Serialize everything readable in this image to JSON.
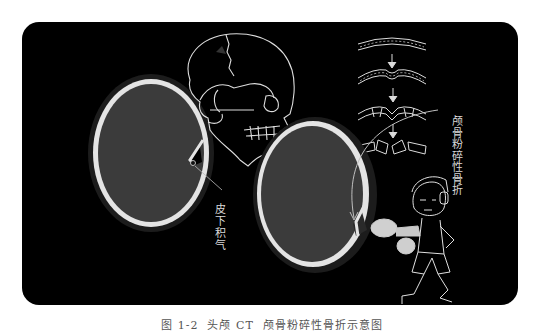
{
  "figure": {
    "panel_background": "#000000",
    "labels": {
      "subcutaneous_emphysema": "皮下积气",
      "comminuted_skull_fracture": "颅骨粉碎性骨折"
    },
    "caption": "图 1-2  头颅 CT  颅骨粉碎性骨折示意图",
    "elements": [
      "ct-scan-left-axial",
      "skull-lateral-line-drawing",
      "fracture-progression-diagram",
      "ct-scan-right-axial",
      "boxer-cartoon-character"
    ],
    "colors": {
      "bone": "#e6e6e6",
      "brain": "#3a3a3a",
      "soft_tissue": "#1f1f1f",
      "line_art": "#dcdcdc"
    }
  }
}
